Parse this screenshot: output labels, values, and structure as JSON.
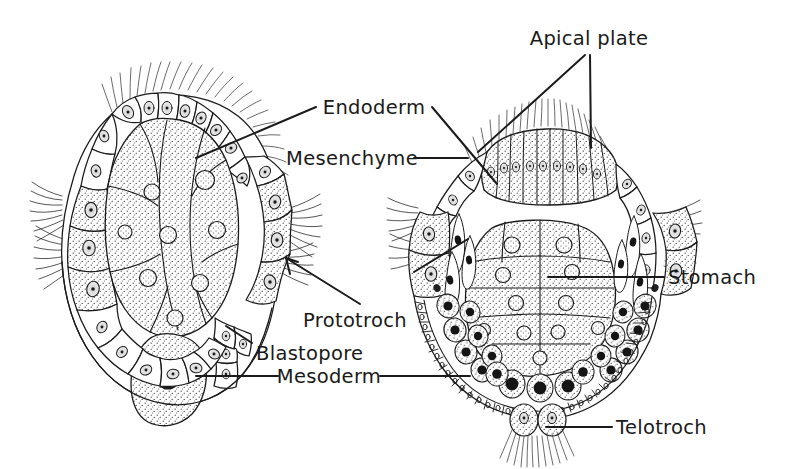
{
  "figure": {
    "kind": "biological-diagram",
    "background_color": "#ffffff",
    "ink_color": "#1a1a1a",
    "stipple_fill": "#fbfbfb"
  },
  "labels": {
    "apical_plate": "Apical plate",
    "endoderm": "Endoderm",
    "mesenchyme": "Mesenchyme",
    "stomach": "Stomach",
    "prototroch": "Prototroch",
    "blastopore": "Blastopore",
    "mesoderm": "Mesoderm",
    "telotroch": "Telotroch"
  },
  "structures": {
    "left_embryo": {
      "name": "early gastrula stage",
      "parts": [
        "endoderm mass",
        "prototroch cells",
        "blastopore",
        "mesoderm cell",
        "ectoderm epithelium"
      ]
    },
    "right_embryo": {
      "name": "trochophore stage",
      "parts": [
        "apical plate",
        "endoderm / stomach",
        "mesenchyme cells",
        "mesoderm band",
        "telotroch",
        "prototroch"
      ]
    }
  }
}
